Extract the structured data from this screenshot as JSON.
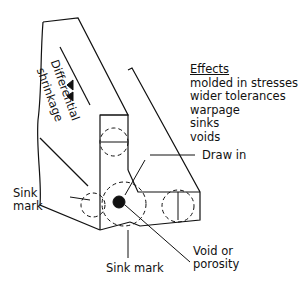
{
  "effects": {
    "heading": "Effects",
    "items": [
      "molded in stresses",
      "wider tolerances",
      "warpage",
      "sinks",
      "voids"
    ]
  },
  "labels": {
    "differential": "Differential",
    "shrinkage": "shrinkage",
    "draw_in": "Draw in",
    "sink_mark_left_1": "Sink",
    "sink_mark_left_2": "mark",
    "void_1": "Void or",
    "void_2": "porosity",
    "sink_mark_bottom": "Sink mark"
  }
}
